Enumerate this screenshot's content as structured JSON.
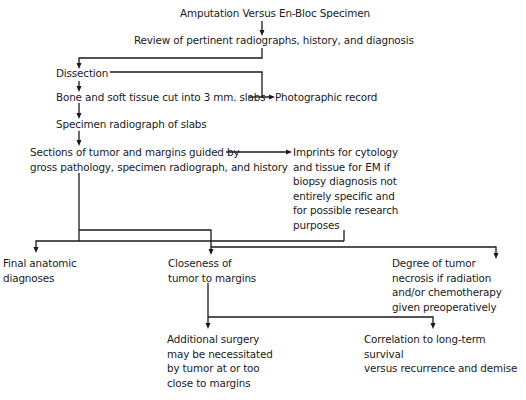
{
  "diagram": {
    "nodes": {
      "title": "Amputation Versus En-Bloc Specimen",
      "review": "Review of pertinent radiographs, history, and diagnosis",
      "dissection": "Dissection",
      "slabs": "Bone and soft tissue cut into 3 mm. slabs",
      "photo": "Photographic record",
      "specimen_radiograph": "Specimen radiograph of slabs",
      "sections": "Sections of tumor and margins guided by\ngross pathology, specimen radiograph, and history",
      "imprints": "Imprints for cytology\nand tissue for EM if\nbiopsy diagnosis not\nentirely specific and\nfor possible research\npurposes",
      "final_diagnoses": "Final anatomic\ndiagnoses",
      "closeness": "Closeness of\ntumor to margins",
      "necrosis": "Degree of tumor\nnecrosis if radiation\nand/or chemotherapy\ngiven preoperatively",
      "additional_surgery": "Additional surgery\nmay be necessitated\nby tumor at or too\nclose to margins",
      "correlation": "Correlation to long-term survival\nversus recurrence and demise"
    },
    "edges": [
      {
        "from": "title",
        "to": "review"
      },
      {
        "from": "review",
        "to": "dissection"
      },
      {
        "from": "dissection",
        "to": "slabs"
      },
      {
        "from": "dissection",
        "to": "photo"
      },
      {
        "from": "slabs",
        "to": "photo"
      },
      {
        "from": "slabs",
        "to": "specimen_radiograph"
      },
      {
        "from": "specimen_radiograph",
        "to": "sections"
      },
      {
        "from": "sections",
        "to": "imprints"
      },
      {
        "from": "sections",
        "to": "final_diagnoses"
      },
      {
        "from": "sections",
        "to": "closeness"
      },
      {
        "from": "imprints",
        "to": "necrosis"
      },
      {
        "from": "sections",
        "to": "necrosis"
      },
      {
        "from": "closeness",
        "to": "additional_surgery"
      },
      {
        "from": "closeness",
        "to": "correlation"
      }
    ]
  }
}
